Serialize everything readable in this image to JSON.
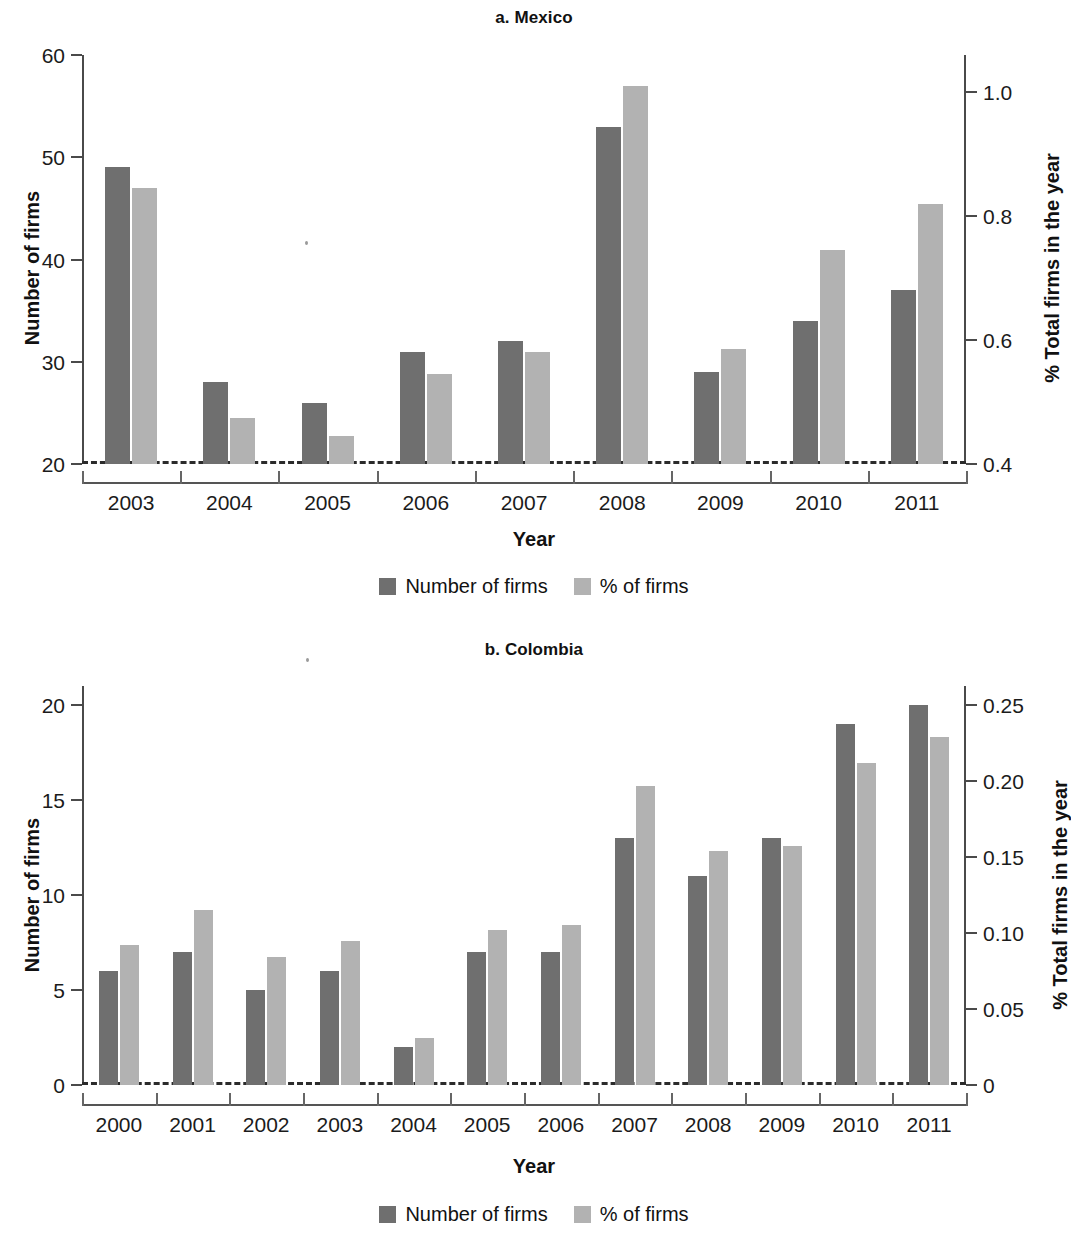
{
  "figure": {
    "background": "#ffffff",
    "dark_color": "#6f6f6f",
    "light_color": "#b2b2b2"
  },
  "legend": {
    "series_1_label": "Number of firms",
    "series_2_label": "% of firms"
  },
  "panels": [
    {
      "key": "mexico",
      "title": "a. Mexico",
      "xlabel": "Year",
      "ylabel_left": "Number of firms",
      "ylabel_right": "% Total firms in the year"
    },
    {
      "key": "colombia",
      "title": "b. Colombia",
      "xlabel": "Year",
      "ylabel_left": "Number of firms",
      "ylabel_right": "% Total firms in the year"
    }
  ],
  "chart_data": [
    {
      "type": "bar",
      "title": "a. Mexico",
      "xlabel": "Year",
      "ylabel": "Number of firms",
      "y2label": "% Total firms in the year",
      "categories": [
        "2003",
        "2004",
        "2005",
        "2006",
        "2007",
        "2008",
        "2009",
        "2010",
        "2011"
      ],
      "series": [
        {
          "name": "Number of firms",
          "axis": "left",
          "color": "#6f6f6f",
          "values": [
            49,
            28,
            26,
            31,
            32,
            53,
            29,
            34,
            37
          ]
        },
        {
          "name": "% of firms",
          "axis": "right",
          "color": "#b2b2b2",
          "values": [
            0.845,
            0.475,
            0.445,
            0.545,
            0.58,
            1.01,
            0.585,
            0.745,
            0.82
          ]
        }
      ],
      "ylim": [
        20,
        60
      ],
      "yticks": [
        20,
        30,
        40,
        50,
        60
      ],
      "ytick_labels": [
        "20",
        "30",
        "40",
        "50",
        "60"
      ],
      "y2lim": [
        0.4,
        1.06
      ],
      "y2ticks": [
        0.4,
        0.6,
        0.8,
        1.0
      ],
      "y2tick_labels": [
        "0.4",
        "0.6",
        "0.8",
        "1.0"
      ],
      "grid": false,
      "legend_position": "bottom-center"
    },
    {
      "type": "bar",
      "title": "b. Colombia",
      "xlabel": "Year",
      "ylabel": "Number of firms",
      "y2label": "% Total firms in the year",
      "categories": [
        "2000",
        "2001",
        "2002",
        "2003",
        "2004",
        "2005",
        "2006",
        "2007",
        "2008",
        "2009",
        "2010",
        "2011"
      ],
      "series": [
        {
          "name": "Number of firms",
          "axis": "left",
          "color": "#6f6f6f",
          "values": [
            6,
            7,
            5,
            6,
            2,
            7,
            7,
            13,
            11,
            13,
            19,
            20
          ]
        },
        {
          "name": "% of firms",
          "axis": "right",
          "color": "#b2b2b2",
          "values": [
            0.092,
            0.115,
            0.084,
            0.095,
            0.031,
            0.102,
            0.105,
            0.197,
            0.154,
            0.157,
            0.212,
            0.229
          ]
        }
      ],
      "ylim": [
        0,
        21
      ],
      "yticks": [
        0,
        5,
        10,
        15,
        20
      ],
      "ytick_labels": [
        "0",
        "5",
        "10",
        "15",
        "20"
      ],
      "y2lim": [
        0,
        0.2625
      ],
      "y2ticks": [
        0,
        0.05,
        0.1,
        0.15,
        0.2,
        0.25
      ],
      "y2tick_labels": [
        "0",
        "0.05",
        "0.10",
        "0.15",
        "0.20",
        "0.25"
      ],
      "grid": false,
      "legend_position": "bottom-center"
    }
  ]
}
